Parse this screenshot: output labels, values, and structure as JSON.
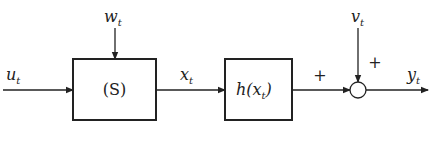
{
  "diagram": {
    "type": "block-diagram",
    "blocks": [
      {
        "id": "system",
        "label": "(S)"
      },
      {
        "id": "observation",
        "label": "h(x",
        "label_sub": "t",
        "label_close": ")"
      }
    ],
    "signals": {
      "input": {
        "name": "u",
        "sub": "t"
      },
      "process_noise": {
        "name": "w",
        "sub": "t"
      },
      "state": {
        "name": "x",
        "sub": "t"
      },
      "measurement_noise": {
        "name": "v",
        "sub": "t"
      },
      "output": {
        "name": "y",
        "sub": "t"
      }
    },
    "summing_junction": {
      "signs": {
        "left": "+",
        "top": "+"
      }
    }
  }
}
